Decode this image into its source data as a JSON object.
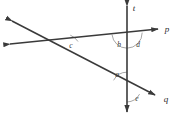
{
  "figure": {
    "type": "geometry-diagram",
    "title": "",
    "background_color": "#ffffff",
    "line_color": "#3a3a3a",
    "arc_color": "#8a8a8a",
    "label_color": "#2b2b2b",
    "width": 180,
    "height": 118
  },
  "lines": [
    {
      "id": "t",
      "label": "t",
      "description": "vertical transversal line with arrowheads at both ends",
      "endpoints": [
        [
          127,
          6
        ],
        [
          127,
          112
        ]
      ],
      "label_position": [
        134,
        10
      ]
    },
    {
      "id": "p",
      "label": "p",
      "description": "near-horizontal line rising slightly to the right, arrowheads at both ends",
      "endpoints": [
        [
          10,
          44
        ],
        [
          158,
          29
        ]
      ],
      "label_position": [
        165,
        30
      ]
    },
    {
      "id": "q",
      "label": "q",
      "description": "slanted line descending to the right, arrowheads at both ends",
      "endpoints": [
        [
          12,
          21
        ],
        [
          155,
          95
        ]
      ],
      "label_position": [
        164,
        99
      ]
    }
  ],
  "intersections": [
    {
      "id": "c-vertex",
      "point": [
        62,
        43
      ],
      "lines": [
        "p",
        "q"
      ]
    },
    {
      "id": "bd-vertex",
      "point": [
        127,
        33
      ],
      "lines": [
        "p",
        "t"
      ]
    },
    {
      "id": "ae-vertex",
      "point": [
        127,
        87
      ],
      "lines": [
        "q",
        "t"
      ]
    }
  ],
  "angles": [
    {
      "id": "c",
      "label": "c",
      "vertex": [
        62,
        43
      ],
      "label_position": [
        70,
        47
      ],
      "description": "angle between line p and line q at their intersection, opening to the right"
    },
    {
      "id": "b",
      "label": "b",
      "vertex": [
        127,
        33
      ],
      "label_position": [
        119,
        46
      ],
      "description": "angle left of line t and below line p"
    },
    {
      "id": "d",
      "label": "d",
      "vertex": [
        127,
        33
      ],
      "label_position": [
        137,
        46
      ],
      "description": "angle right of line t and below line p"
    },
    {
      "id": "a",
      "label": "a",
      "vertex": [
        127,
        87
      ],
      "label_position": [
        117,
        76
      ],
      "description": "angle left of line t and above line q"
    },
    {
      "id": "e",
      "label": "e",
      "vertex": [
        127,
        87
      ],
      "label_position": [
        136,
        99
      ],
      "description": "angle right of line t and below line q"
    }
  ]
}
